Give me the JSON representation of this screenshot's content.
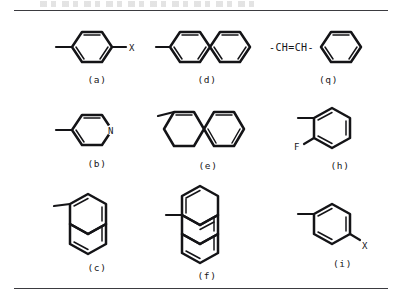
{
  "figure": {
    "background": "#ffffff",
    "ink": "#141417",
    "rule_color": "#3b3b40",
    "top_rule": true,
    "bottom_rule": true,
    "header_text": ""
  },
  "structures": [
    {
      "id": "a",
      "caption": "(a)",
      "name": "para-substituted-benzene",
      "description": "benzene ring with methyl at left and X at right",
      "ring_count": 1,
      "labels": [
        "X"
      ],
      "substituent_right": "X",
      "substituent_left": "methyl"
    },
    {
      "id": "b",
      "caption": "(b)",
      "name": "pyridine",
      "description": "pyridine ring with nitrogen at right vertex and methyl at left",
      "ring_count": 1,
      "labels": [
        "N"
      ],
      "heteroatom": "N",
      "substituent_left": "methyl"
    },
    {
      "id": "c",
      "caption": "(c)",
      "name": "naphthalene-vertical",
      "description": "vertically fused naphthalene with methyl at upper left",
      "ring_count": 2,
      "labels": [],
      "substituent_left": "methyl"
    },
    {
      "id": "d",
      "caption": "(d)",
      "name": "biphenyl",
      "description": "two benzene rings joined by a single bond, methyl at far left",
      "ring_count": 2,
      "labels": [],
      "substituent_left": "methyl"
    },
    {
      "id": "e",
      "caption": "(e)",
      "name": "naphthalene-horizontal",
      "description": "horizontally fused naphthalene with methyl at upper left",
      "ring_count": 2,
      "labels": [],
      "substituent_left": "methyl"
    },
    {
      "id": "f",
      "caption": "(f)",
      "name": "anthracene-vertical",
      "description": "three vertically fused rings with methyl at middle left",
      "ring_count": 3,
      "labels": [],
      "substituent_left": "methyl"
    },
    {
      "id": "g",
      "caption": "(q)",
      "name": "styryl-group",
      "description": "-CH=CH- chain attached to a benzene ring",
      "ring_count": 1,
      "labels": [
        "-CH=CH-"
      ],
      "chain_text": "-CH=CH-"
    },
    {
      "id": "h",
      "caption": "(h)",
      "name": "ortho-fluorotoluene",
      "description": "benzene ring with methyl at left and F at lower left",
      "ring_count": 1,
      "labels": [
        "F"
      ],
      "substituent_left": "methyl",
      "substituent_lower_left": "F"
    },
    {
      "id": "i",
      "caption": "(i)",
      "name": "meta-substituted-benzene",
      "description": "benzene ring with methyl at left and X at lower right",
      "ring_count": 1,
      "labels": [
        "X"
      ],
      "substituent_left": "methyl",
      "substituent_lower_right": "X"
    }
  ]
}
